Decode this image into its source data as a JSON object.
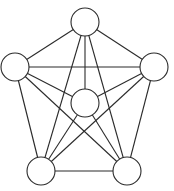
{
  "diagram": {
    "type": "complete-graph",
    "name": "K6",
    "canvas": {
      "width": 174,
      "height": 191
    },
    "colors": {
      "stroke": "#2b2b2b",
      "node_fill": "#ffffff",
      "background": "#ffffff"
    },
    "node_radius": 14,
    "nodes": [
      {
        "id": "top",
        "x": 85,
        "y": 22
      },
      {
        "id": "left",
        "x": 15,
        "y": 67
      },
      {
        "id": "right",
        "x": 154,
        "y": 67
      },
      {
        "id": "center",
        "x": 85,
        "y": 103
      },
      {
        "id": "bottom-left",
        "x": 41,
        "y": 171
      },
      {
        "id": "bottom-right",
        "x": 127,
        "y": 171
      }
    ],
    "edges": [
      [
        "top",
        "left"
      ],
      [
        "top",
        "right"
      ],
      [
        "top",
        "center"
      ],
      [
        "top",
        "bottom-left"
      ],
      [
        "top",
        "bottom-right"
      ],
      [
        "left",
        "right"
      ],
      [
        "left",
        "center"
      ],
      [
        "left",
        "bottom-left"
      ],
      [
        "left",
        "bottom-right"
      ],
      [
        "right",
        "center"
      ],
      [
        "right",
        "bottom-left"
      ],
      [
        "right",
        "bottom-right"
      ],
      [
        "center",
        "bottom-left"
      ],
      [
        "center",
        "bottom-right"
      ],
      [
        "bottom-left",
        "bottom-right"
      ]
    ]
  }
}
